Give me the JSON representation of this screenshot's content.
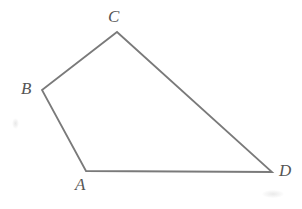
{
  "figure": {
    "background_color": "#ffffff",
    "stroke_color": "#7a7a7a",
    "stroke_width": 1.8,
    "label_color": "#555555",
    "width": 302,
    "height": 209
  },
  "chart_data": {
    "type": "diagram",
    "shape": "quadrilateral",
    "title": "",
    "vertices": [
      {
        "name": "A",
        "x": 86,
        "y": 171
      },
      {
        "name": "B",
        "x": 42,
        "y": 90
      },
      {
        "name": "C",
        "x": 117,
        "y": 32
      },
      {
        "name": "D",
        "x": 272,
        "y": 172
      }
    ],
    "edges": [
      {
        "from": "A",
        "to": "B"
      },
      {
        "from": "B",
        "to": "C"
      },
      {
        "from": "C",
        "to": "D"
      },
      {
        "from": "D",
        "to": "A"
      }
    ],
    "labels": [
      {
        "text": "A",
        "position": "below-vertex"
      },
      {
        "text": "B",
        "position": "left-of-vertex"
      },
      {
        "text": "C",
        "position": "above-vertex"
      },
      {
        "text": "D",
        "position": "right-of-vertex"
      }
    ]
  },
  "labels": {
    "A": "A",
    "B": "B",
    "C": "C",
    "D": "D"
  },
  "artifacts": [
    {
      "name": "scan-smudge-left",
      "x": 12,
      "y": 118
    },
    {
      "name": "scan-smudge-bottom-right",
      "x": 262,
      "y": 190
    }
  ]
}
